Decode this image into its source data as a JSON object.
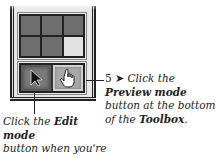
{
  "toolbox": {
    "grid_cells": [
      {
        "state": "dark"
      },
      {
        "state": "dark"
      },
      {
        "state": "dark"
      },
      {
        "state": "dark"
      },
      {
        "state": "dark"
      },
      {
        "state": "light"
      }
    ],
    "buttons": {
      "edit_mode": {
        "icon": "arrow-pointer-icon",
        "glyph": "▶",
        "state": "pressed"
      },
      "preview_mode": {
        "icon": "hand-pointer-icon",
        "glyph": "☝",
        "state": "raised"
      }
    },
    "colors": {
      "cell_dark": "#6e6e6e",
      "cell_light": "#e2e2e2",
      "edit_button": "#7a7a7a",
      "preview_button": "#a8a8a8"
    }
  },
  "callouts": {
    "right": {
      "step_number": "5",
      "step_arrow": "➤",
      "line1": "Click the",
      "bold1": "Preview mode",
      "line2": "button at the bottom",
      "line3_prefix": "of the ",
      "bold2": "Toolbox",
      "line3_suffix": "."
    },
    "left": {
      "line1_prefix": "Click the ",
      "bold1": "Edit mode",
      "line2": "button when you're",
      "line3": "done previewing."
    }
  }
}
